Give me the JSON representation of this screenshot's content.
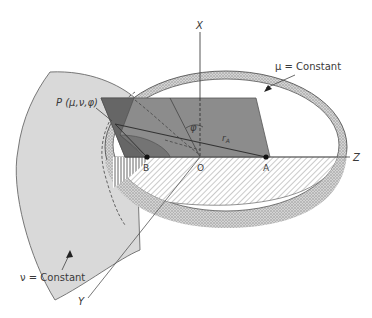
{
  "figure": {
    "labels": {
      "axis_x": "X",
      "axis_y": "Y",
      "axis_z": "Z",
      "point_p": "P (μ,ν,φ)",
      "point_a": "A",
      "point_b": "B",
      "origin": "O",
      "angle_phi": "φ",
      "radius_ra": "r",
      "radius_ra_sub": "A",
      "mu_surface": "μ = Constant",
      "nu_surface": "ν = Constant"
    },
    "colors": {
      "background": "#ffffff",
      "line": "#4a4a4a",
      "nu_surface_fill": "#d9d9d9",
      "phi_plane_fill": "#8c8c8c",
      "phi_plane_dark": "#6e6e6e",
      "mu_band_fill": "#c9c9c9",
      "text": "#3a3a3a"
    }
  }
}
